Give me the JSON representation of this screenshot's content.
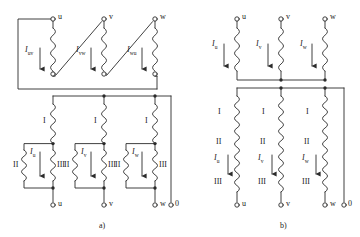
{
  "figure": {
    "kind": "transformer-winding-connection-diagram",
    "captions": [
      {
        "id": "a",
        "text": "a)"
      },
      {
        "id": "b",
        "text": "b)"
      }
    ]
  },
  "diagram_a": {
    "name": "delta-connected-windings",
    "top_terminals": [
      "u",
      "v",
      "w"
    ],
    "bottom_terminals": [
      "u",
      "v",
      "w",
      "0"
    ],
    "delta_currents": [
      {
        "label": "I",
        "sub": "uv"
      },
      {
        "label": "I",
        "sub": "vw"
      },
      {
        "label": "I",
        "sub": "wu"
      }
    ],
    "phase_currents": [
      {
        "label": "I",
        "sub": "u"
      },
      {
        "label": "I",
        "sub": "v"
      },
      {
        "label": "I",
        "sub": "w"
      }
    ],
    "winding_labels_series": [
      "I",
      "I",
      "I"
    ],
    "winding_labels_left": [
      "II",
      "II",
      "II"
    ],
    "winding_labels_right": [
      "III",
      "III",
      "III"
    ]
  },
  "diagram_b": {
    "name": "star-connected-windings",
    "top_terminals": [
      "u",
      "v",
      "w"
    ],
    "bottom_terminals": [
      "u",
      "v",
      "w",
      "0"
    ],
    "line_currents": [
      {
        "label": "I",
        "sub": "u"
      },
      {
        "label": "I",
        "sub": "v"
      },
      {
        "label": "I",
        "sub": "w"
      }
    ],
    "phase_currents": [
      {
        "label": "I",
        "sub": "u"
      },
      {
        "label": "I",
        "sub": "v"
      },
      {
        "label": "I",
        "sub": "w"
      }
    ],
    "winding_labels": [
      "I",
      "II",
      "III"
    ]
  },
  "colors": {
    "line": "#2b2b2b",
    "text": "#1a1a1a",
    "background": "#ffffff"
  }
}
